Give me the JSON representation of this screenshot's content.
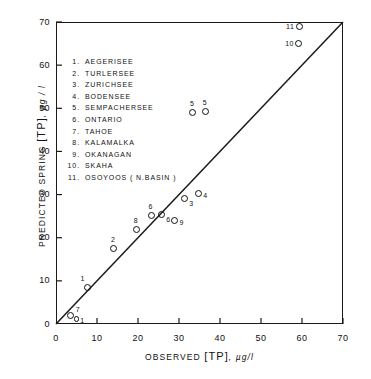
{
  "chart_data": {
    "type": "scatter",
    "title": "",
    "xlabel": "OBSERVED  [TP], µg/l",
    "ylabel": "PREDICTED SPRING [TP], µg / l",
    "xlim": [
      0,
      70
    ],
    "ylim": [
      0,
      70
    ],
    "xticks": [
      0,
      10,
      20,
      30,
      40,
      50,
      60,
      70
    ],
    "yticks": [
      0,
      10,
      20,
      30,
      40,
      50,
      60,
      70
    ],
    "grid": false,
    "legend_position": "upper-left-inside",
    "reference_line": {
      "name": "1:1 line",
      "from": [
        0,
        0
      ],
      "to": [
        70,
        70
      ]
    },
    "series": [
      {
        "name": "lakes",
        "marker": "open-circle",
        "points": [
          {
            "id": "7",
            "label": "7",
            "name": "TAHOE",
            "x": 3.5,
            "y": 2.0,
            "label_pos": "right-up"
          },
          {
            "id": "1b",
            "label": "1",
            "name": "AEGERISEE",
            "x": 5.0,
            "y": 1.2,
            "label_pos": "right",
            "size": "small"
          },
          {
            "id": "1",
            "label": "1",
            "name": "AEGERISEE",
            "x": 7.8,
            "y": 8.5,
            "label_pos": "above-left"
          },
          {
            "id": "2",
            "label": "2",
            "name": "TURLERSEE",
            "x": 14.0,
            "y": 17.5,
            "label_pos": "above"
          },
          {
            "id": "8",
            "label": "8",
            "name": "KALAMALKA",
            "x": 19.6,
            "y": 22.0,
            "label_pos": "above"
          },
          {
            "id": "6a",
            "label": "6",
            "name": "ONTARIO",
            "x": 23.2,
            "y": 25.2,
            "label_pos": "above"
          },
          {
            "id": "6b",
            "label": "6",
            "name": "ONTARIO",
            "x": 25.8,
            "y": 25.4,
            "label_pos": "below-right"
          },
          {
            "id": "9",
            "label": "9",
            "name": "OKANAGAN",
            "x": 29.0,
            "y": 24.0,
            "label_pos": "right"
          },
          {
            "id": "3",
            "label": "3",
            "name": "ZURICHSEE",
            "x": 31.4,
            "y": 29.0,
            "label_pos": "below-right"
          },
          {
            "id": "4",
            "label": "4",
            "name": "BODENSEE",
            "x": 34.8,
            "y": 30.2,
            "label_pos": "right"
          },
          {
            "id": "5a",
            "label": "5",
            "name": "SEMPACHERSEE",
            "x": 33.3,
            "y": 49.0,
            "label_pos": "above"
          },
          {
            "id": "5b",
            "label": "5",
            "name": "SEMPACHERSEE",
            "x": 36.4,
            "y": 49.2,
            "label_pos": "above"
          },
          {
            "id": "10",
            "label": "10",
            "name": "SKAHA",
            "x": 59.2,
            "y": 65.0,
            "label_pos": "left"
          },
          {
            "id": "11",
            "label": "11",
            "name": "OSOYOOS (N.BASIN)",
            "x": 59.4,
            "y": 69.0,
            "label_pos": "left"
          }
        ]
      }
    ],
    "legend_entries": [
      {
        "num": "1.",
        "name": "AEGERISEE"
      },
      {
        "num": "2.",
        "name": "TURLERSEE"
      },
      {
        "num": "3.",
        "name": "ZURICHSEE"
      },
      {
        "num": "4.",
        "name": "BODENSEE"
      },
      {
        "num": "5.",
        "name": "SEMPACHERSEE"
      },
      {
        "num": "6.",
        "name": "ONTARIO"
      },
      {
        "num": "7.",
        "name": "TAHOE"
      },
      {
        "num": "8.",
        "name": "KALAMALKA"
      },
      {
        "num": "9.",
        "name": "OKANAGAN"
      },
      {
        "num": "10.",
        "name": "SKAHA"
      },
      {
        "num": "11.",
        "name": "OSOYOOS  ( N.BASIN )"
      }
    ]
  },
  "axes": {
    "x_title_main": "OBSERVED",
    "x_title_bracket": "[TP]",
    "x_title_units": ", µg/l",
    "y_title_main": "PREDICTED SPRING",
    "y_title_bracket": "[TP]",
    "y_title_units": ", µg / l"
  },
  "colors": {
    "ink": "#111111",
    "background": "#ffffff"
  }
}
